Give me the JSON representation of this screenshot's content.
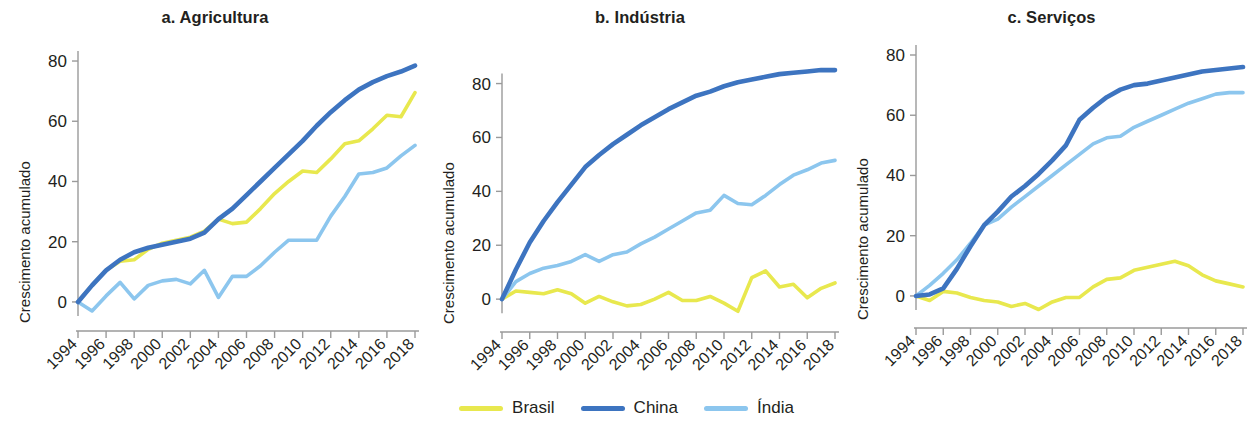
{
  "figure": {
    "ylabel": "Crescimento acumulado",
    "legend_position": "bottom-center"
  },
  "legend": {
    "items": [
      {
        "label": "Brasil",
        "color": "#e8e84e"
      },
      {
        "label": "China",
        "color": "#3d74c0"
      },
      {
        "label": "Índia",
        "color": "#8cc6ee"
      }
    ]
  },
  "panels": [
    {
      "id": "agricultura",
      "title": "a. Agricultura"
    },
    {
      "id": "industria",
      "title": "b. Indústria"
    },
    {
      "id": "servicos",
      "title": "c. Serviços"
    }
  ],
  "chart_data": [
    {
      "type": "line",
      "title": "a. Agricultura",
      "xlabel": "",
      "ylabel": "Crescimento acumulado",
      "grid": false,
      "legend": "bottom-center",
      "xlim": [
        1994,
        2018
      ],
      "ylim": [
        -5,
        82
      ],
      "yticks": [
        0,
        20,
        40,
        60,
        80
      ],
      "xticks": [
        1994,
        1996,
        1998,
        2000,
        2002,
        2004,
        2006,
        2008,
        2010,
        2012,
        2014,
        2016,
        2018
      ],
      "x": [
        1994,
        1995,
        1996,
        1997,
        1998,
        1999,
        2000,
        2001,
        2002,
        2003,
        2004,
        2005,
        2006,
        2007,
        2008,
        2009,
        2010,
        2011,
        2012,
        2013,
        2014,
        2015,
        2016,
        2017,
        2018
      ],
      "series": [
        {
          "name": "Brasil",
          "color": "#e8e84e",
          "values": [
            0,
            5.5,
            10.5,
            13.5,
            14.0,
            17.5,
            19.5,
            20.5,
            21.5,
            23.5,
            27.5,
            26.0,
            26.5,
            31.0,
            36.0,
            40.0,
            43.5,
            43.0,
            47.5,
            52.5,
            53.5,
            57.5,
            62.0,
            61.5,
            69.5
          ]
        },
        {
          "name": "China",
          "color": "#3d74c0",
          "values": [
            0,
            5.5,
            10.5,
            14.0,
            16.5,
            18.0,
            19.0,
            20.0,
            21.0,
            23.0,
            27.5,
            31.0,
            35.5,
            40.0,
            44.5,
            49.0,
            53.5,
            58.5,
            63.0,
            67.0,
            70.5,
            73.0,
            75.0,
            76.5,
            78.5
          ]
        },
        {
          "name": "Índia",
          "color": "#8cc6ee",
          "values": [
            0,
            -3.0,
            2.0,
            6.5,
            1.0,
            5.5,
            7.0,
            7.5,
            6.0,
            10.5,
            1.5,
            8.5,
            8.5,
            12.0,
            16.5,
            20.5,
            20.5,
            20.5,
            28.5,
            35.0,
            42.5,
            43.0,
            44.5,
            48.5,
            52.0
          ]
        }
      ]
    },
    {
      "type": "line",
      "title": "b. Indústria",
      "xlabel": "",
      "ylabel": "Crescimento acumulado",
      "grid": false,
      "legend": "bottom-center",
      "xlim": [
        1994,
        2018
      ],
      "ylim": [
        -7,
        88
      ],
      "yticks": [
        0,
        20,
        40,
        60,
        80
      ],
      "xticks": [
        1994,
        1996,
        1998,
        2000,
        2002,
        2004,
        2006,
        2008,
        2010,
        2012,
        2014,
        2016,
        2018
      ],
      "x": [
        1994,
        1995,
        1996,
        1997,
        1998,
        1999,
        2000,
        2001,
        2002,
        2003,
        2004,
        2005,
        2006,
        2007,
        2008,
        2009,
        2010,
        2011,
        2012,
        2013,
        2014,
        2015,
        2016,
        2017,
        2018
      ],
      "series": [
        {
          "name": "Brasil",
          "color": "#e8e84e",
          "values": [
            0,
            3.0,
            2.5,
            2.0,
            3.5,
            2.0,
            -1.5,
            1.0,
            -1.0,
            -2.5,
            -2.0,
            0.0,
            2.5,
            -0.5,
            -0.5,
            1.0,
            -1.5,
            -4.5,
            8.0,
            10.5,
            4.5,
            5.5,
            0.5,
            4.0,
            6.0
          ]
        },
        {
          "name": "China",
          "color": "#3d74c0",
          "values": [
            0,
            11.0,
            21.0,
            29.0,
            36.0,
            42.5,
            49.0,
            53.5,
            57.5,
            61.0,
            64.5,
            67.5,
            70.5,
            73.0,
            75.5,
            77.0,
            79.0,
            80.5,
            81.5,
            82.5,
            83.5,
            84.0,
            84.5,
            85.0,
            85.0
          ]
        },
        {
          "name": "Índia",
          "color": "#8cc6ee",
          "values": [
            0,
            6.5,
            9.5,
            11.5,
            12.5,
            14.0,
            16.5,
            14.0,
            16.5,
            17.5,
            20.5,
            23.0,
            26.0,
            29.0,
            32.0,
            33.0,
            38.5,
            35.5,
            35.0,
            38.5,
            42.5,
            46.0,
            48.0,
            50.5,
            51.5
          ]
        }
      ]
    },
    {
      "type": "line",
      "title": "c. Serviços",
      "xlabel": "",
      "ylabel": "Crescimento acumulado",
      "grid": false,
      "legend": "bottom-center",
      "xlim": [
        1994,
        2018
      ],
      "ylim": [
        -6,
        80
      ],
      "yticks": [
        0,
        20,
        40,
        60,
        80
      ],
      "xticks": [
        1994,
        1996,
        1998,
        2000,
        2002,
        2004,
        2006,
        2008,
        2010,
        2012,
        2014,
        2016,
        2018
      ],
      "x": [
        1994,
        1995,
        1996,
        1997,
        1998,
        1999,
        2000,
        2001,
        2002,
        2003,
        2004,
        2005,
        2006,
        2007,
        2008,
        2009,
        2010,
        2011,
        2012,
        2013,
        2014,
        2015,
        2016,
        2017,
        2018
      ],
      "series": [
        {
          "name": "Brasil",
          "color": "#e8e84e",
          "values": [
            0,
            -1.5,
            1.5,
            1.0,
            -0.5,
            -1.5,
            -2.0,
            -3.5,
            -2.5,
            -4.5,
            -2.0,
            -0.5,
            -0.5,
            3.0,
            5.5,
            6.0,
            8.5,
            9.5,
            10.5,
            11.5,
            10.0,
            7.0,
            5.0,
            4.0,
            3.0
          ]
        },
        {
          "name": "China",
          "color": "#3d74c0",
          "values": [
            0,
            0.5,
            2.5,
            9.0,
            16.5,
            23.5,
            28.0,
            33.0,
            36.5,
            40.5,
            45.0,
            50.0,
            58.5,
            62.5,
            66.0,
            68.5,
            70.0,
            70.5,
            71.5,
            72.5,
            73.5,
            74.5,
            75.0,
            75.5,
            76.0
          ]
        },
        {
          "name": "Índia",
          "color": "#8cc6ee",
          "values": [
            0,
            3.5,
            7.5,
            12.0,
            17.5,
            23.5,
            25.5,
            29.5,
            33.0,
            36.5,
            40.0,
            43.5,
            47.0,
            50.5,
            52.5,
            53.0,
            56.0,
            58.0,
            60.0,
            62.0,
            64.0,
            65.5,
            67.0,
            67.5,
            67.5
          ]
        }
      ]
    }
  ]
}
